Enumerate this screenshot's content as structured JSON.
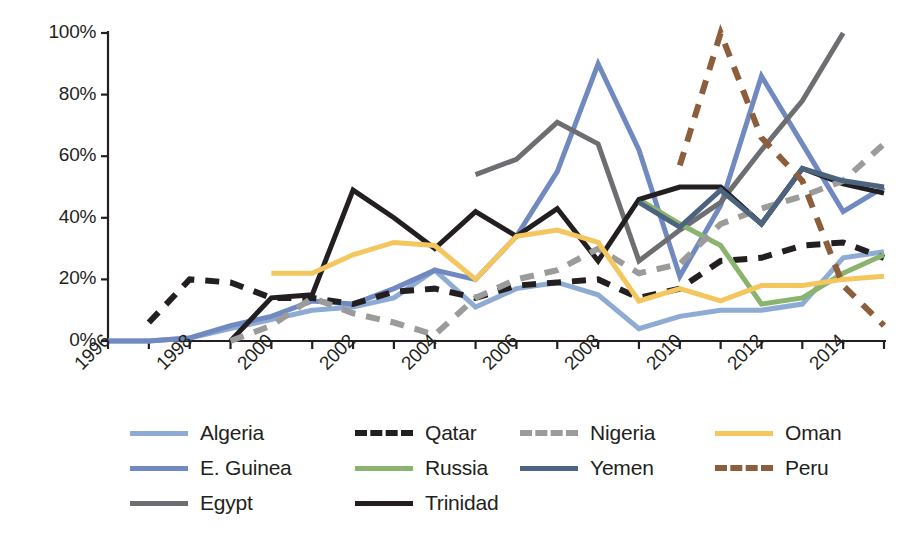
{
  "chart_data": {
    "type": "line",
    "title": "",
    "subtitle": "",
    "xlabel": "",
    "ylabel": "",
    "xlim": [
      1996,
      2015
    ],
    "ylim": [
      0,
      100
    ],
    "grid": false,
    "legend_position": "bottom",
    "y_ticks": [
      "0%",
      "20%",
      "40%",
      "60%",
      "80%",
      "100%"
    ],
    "y_tick_values": [
      0,
      20,
      40,
      60,
      80,
      100
    ],
    "x_ticks": [
      "1996",
      "1998",
      "2000",
      "2002",
      "2004",
      "2006",
      "2008",
      "2010",
      "2012",
      "2014"
    ],
    "x_tick_values": [
      1996,
      1998,
      2000,
      2002,
      2004,
      2006,
      2008,
      2010,
      2012,
      2014
    ],
    "x_minor_step": 1,
    "series": [
      {
        "name": "Algeria",
        "color": "#8eabd4",
        "style": "solid",
        "width": 5,
        "x": [
          1996,
          1997,
          1998,
          1999,
          2000,
          2001,
          2002,
          2003,
          2004,
          2005,
          2006,
          2007,
          2008,
          2009,
          2010,
          2011,
          2012,
          2013,
          2014,
          2015
        ],
        "values": [
          0,
          0,
          1,
          4,
          7,
          10,
          11,
          14,
          23,
          11,
          17,
          19,
          15,
          4,
          8,
          10,
          10,
          12,
          27,
          29
        ]
      },
      {
        "name": "E. Guinea",
        "color": "#7089c0",
        "style": "solid",
        "width": 5,
        "x": [
          1996,
          1997,
          1998,
          1999,
          2000,
          2001,
          2002,
          2003,
          2004,
          2005,
          2006,
          2007,
          2008,
          2009,
          2010,
          2011,
          2012,
          2013,
          2014,
          2015
        ],
        "values": [
          0,
          0,
          1,
          5,
          8,
          13,
          12,
          17,
          23,
          20,
          34,
          55,
          90,
          62,
          21,
          44,
          86,
          64,
          42,
          50
        ]
      },
      {
        "name": "Egypt",
        "color": "#6d6e71",
        "style": "solid",
        "width": 5,
        "x": [
          2005,
          2006,
          2007,
          2008,
          2009,
          2010,
          2011,
          2012,
          2013,
          2014
        ],
        "values": [
          54,
          59,
          71,
          64,
          26,
          36,
          45,
          62,
          78,
          100
        ]
      },
      {
        "name": "Qatar",
        "color": "#231f20",
        "style": "dashed",
        "width": 6,
        "x": [
          1997,
          1998,
          1999,
          2000,
          2001,
          2002,
          2003,
          2004,
          2005,
          2006,
          2007,
          2008,
          2009,
          2010,
          2011,
          2012,
          2013,
          2014,
          2015
        ],
        "values": [
          6,
          20,
          19,
          14,
          14,
          12,
          16,
          17,
          14,
          18,
          19,
          20,
          14,
          17,
          26,
          27,
          31,
          32,
          27
        ]
      },
      {
        "name": "Russia",
        "color": "#8ab36d",
        "style": "solid",
        "width": 5,
        "x": [
          2009,
          2010,
          2011,
          2012,
          2013,
          2014,
          2015
        ],
        "values": [
          46,
          38,
          31,
          12,
          14,
          22,
          28
        ]
      },
      {
        "name": "Trinidad",
        "color": "#231f20",
        "style": "solid",
        "width": 5,
        "x": [
          1999,
          2000,
          2001,
          2002,
          2003,
          2004,
          2005,
          2006,
          2007,
          2008,
          2009,
          2010,
          2011,
          2012,
          2013,
          2014,
          2015
        ],
        "values": [
          0,
          14,
          15,
          49,
          40,
          30,
          42,
          34,
          43,
          26,
          46,
          50,
          50,
          38,
          56,
          51,
          48
        ]
      },
      {
        "name": "Nigeria",
        "color": "#9b9b9b",
        "style": "dashed",
        "width": 6,
        "x": [
          1999,
          2000,
          2001,
          2002,
          2003,
          2004,
          2005,
          2006,
          2007,
          2008,
          2009,
          2010,
          2011,
          2012,
          2013,
          2014,
          2015
        ],
        "values": [
          0,
          5,
          14,
          9,
          6,
          2,
          14,
          20,
          23,
          30,
          22,
          25,
          38,
          43,
          47,
          52,
          64
        ]
      },
      {
        "name": "Yemen",
        "color": "#4d6480",
        "style": "solid",
        "width": 5,
        "x": [
          2009,
          2010,
          2011,
          2012,
          2013,
          2014,
          2015
        ],
        "values": [
          45,
          37,
          49,
          38,
          56,
          52,
          50
        ]
      },
      {
        "name": "Oman",
        "color": "#f4c75e",
        "style": "solid",
        "width": 5,
        "x": [
          2000,
          2001,
          2002,
          2003,
          2004,
          2005,
          2006,
          2007,
          2008,
          2009,
          2010,
          2011,
          2012,
          2013,
          2014,
          2015
        ],
        "values": [
          22,
          22,
          28,
          32,
          31,
          20,
          34,
          36,
          32,
          13,
          17,
          13,
          18,
          18,
          20,
          21
        ]
      },
      {
        "name": "Peru",
        "color": "#8c5e3c",
        "style": "dashed",
        "width": 6,
        "x": [
          2010,
          2011,
          2012,
          2013,
          2014,
          2015
        ],
        "values": [
          57,
          100,
          66,
          52,
          18,
          5
        ]
      }
    ]
  },
  "legend": {
    "items": [
      {
        "label": "Algeria",
        "series": "Algeria"
      },
      {
        "label": "Qatar",
        "series": "Qatar"
      },
      {
        "label": "Nigeria",
        "series": "Nigeria"
      },
      {
        "label": "Oman",
        "series": "Oman"
      },
      {
        "label": "E. Guinea",
        "series": "E. Guinea"
      },
      {
        "label": "Russia",
        "series": "Russia"
      },
      {
        "label": "Yemen",
        "series": "Yemen"
      },
      {
        "label": "Peru",
        "series": "Peru"
      },
      {
        "label": "Egypt",
        "series": "Egypt"
      },
      {
        "label": "Trinidad",
        "series": "Trinidad"
      }
    ]
  },
  "axes": {
    "axis_color": "#231f20",
    "tick_color": "#231f20"
  }
}
